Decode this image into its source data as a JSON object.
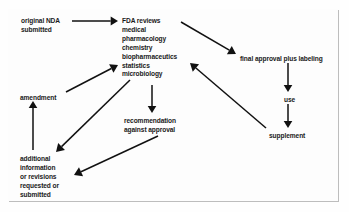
{
  "diagram": {
    "frame": {
      "border_color": "#2a2a2a",
      "background": "#fdfdfd"
    },
    "text_color": "#1a1a1a",
    "arrow_color": "#111111",
    "nodes": [
      {
        "id": "original-nda",
        "name": "original-nda-submitted",
        "lines": [
          "original NDA",
          "submitted"
        ],
        "x": 21,
        "y": 17
      },
      {
        "id": "fda-reviews",
        "name": "fda-reviews",
        "lines": [
          "FDA reviews",
          "medical",
          "pharmacology",
          "chemistry",
          "biopharmaceutics",
          "statistics",
          "microbiology"
        ],
        "x": 122,
        "y": 17
      },
      {
        "id": "final-approval",
        "name": "final-approval-plus-labeling",
        "lines": [
          "final approval plus labeling"
        ],
        "x": 240,
        "y": 55
      },
      {
        "id": "use",
        "name": "use",
        "lines": [
          "use"
        ],
        "x": 284,
        "y": 96
      },
      {
        "id": "supplement",
        "name": "supplement",
        "lines": [
          "supplement"
        ],
        "x": 269,
        "y": 132
      },
      {
        "id": "amendment",
        "name": "amendment",
        "lines": [
          "amendment"
        ],
        "x": 20,
        "y": 94
      },
      {
        "id": "recommendation",
        "name": "recommendation-against-approval",
        "lines": [
          "recommendation",
          "against approval"
        ],
        "x": 124,
        "y": 117
      },
      {
        "id": "additional-info",
        "name": "additional-information-or-revisions",
        "lines": [
          "additional",
          "information",
          "or revisions",
          "requested or",
          "submitted"
        ],
        "x": 20,
        "y": 155
      }
    ],
    "arrows": [
      {
        "id": "a1",
        "name": "arrow-original-nda-to-fda-reviews",
        "from": "original-nda",
        "to": "fda-reviews",
        "x1": 72,
        "y1": 21,
        "x2": 118,
        "y2": 21,
        "head": 3.4
      },
      {
        "id": "a2",
        "name": "arrow-fda-reviews-to-final-approval",
        "from": "fda-reviews",
        "to": "final-approval",
        "x1": 181,
        "y1": 22,
        "x2": 236,
        "y2": 54,
        "head": 3.6
      },
      {
        "id": "a3",
        "name": "arrow-final-approval-to-use",
        "from": "final-approval",
        "to": "use",
        "x1": 288,
        "y1": 63,
        "x2": 288,
        "y2": 92,
        "head": 3.2
      },
      {
        "id": "a4",
        "name": "arrow-use-to-supplement",
        "from": "use",
        "to": "supplement",
        "x1": 288,
        "y1": 104,
        "x2": 288,
        "y2": 128,
        "head": 3.2
      },
      {
        "id": "a5",
        "name": "arrow-supplement-to-fda-reviews",
        "from": "supplement",
        "to": "fda-reviews",
        "x1": 266,
        "y1": 128,
        "x2": 190,
        "y2": 63,
        "head": 3.6
      },
      {
        "id": "a6",
        "name": "arrow-fda-reviews-to-recommendation",
        "from": "fda-reviews",
        "to": "recommendation",
        "x1": 152,
        "y1": 85,
        "x2": 152,
        "y2": 113,
        "head": 3.2
      },
      {
        "id": "a7",
        "name": "arrow-amendment-to-fda-reviews",
        "from": "amendment",
        "to": "fda-reviews",
        "x1": 66,
        "y1": 92,
        "x2": 118,
        "y2": 65,
        "head": 3.5
      },
      {
        "id": "a8",
        "name": "arrow-fda-reviews-to-additional-info",
        "from": "fda-reviews",
        "to": "additional-info",
        "x1": 130,
        "y1": 80,
        "x2": 56,
        "y2": 152,
        "head": 3.6
      },
      {
        "id": "a9",
        "name": "arrow-additional-info-to-amendment",
        "from": "additional-info",
        "to": "amendment",
        "x1": 33,
        "y1": 150,
        "x2": 33,
        "y2": 101,
        "head": 3.2
      },
      {
        "id": "a10",
        "name": "arrow-recommendation-to-additional-info",
        "from": "recommendation",
        "to": "additional-info",
        "x1": 158,
        "y1": 136,
        "x2": 74,
        "y2": 175,
        "head": 3.6
      }
    ]
  }
}
